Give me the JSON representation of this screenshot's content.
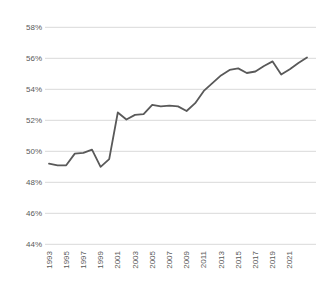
{
  "chart_data": {
    "type": "line",
    "title": "",
    "xlabel": "",
    "ylabel": "",
    "x": [
      1993,
      1994,
      1995,
      1996,
      1997,
      1998,
      1999,
      2000,
      2001,
      2002,
      2003,
      2004,
      2005,
      2006,
      2007,
      2008,
      2009,
      2010,
      2011,
      2012,
      2013,
      2014,
      2015,
      2016,
      2017,
      2018,
      2019,
      2020,
      2021,
      2022,
      2023
    ],
    "series": [
      {
        "name": "percentage-share",
        "values": [
          49.2,
          49.1,
          49.1,
          49.85,
          49.9,
          50.1,
          49.0,
          49.5,
          52.5,
          52.05,
          52.35,
          52.4,
          53.0,
          52.9,
          52.95,
          52.9,
          52.6,
          53.1,
          53.9,
          54.4,
          54.9,
          55.25,
          55.35,
          55.05,
          55.15,
          55.5,
          55.8,
          54.95,
          55.3,
          55.7,
          56.05
        ]
      }
    ],
    "xlim": [
      1993,
      2023
    ],
    "ylim": [
      44,
      58
    ],
    "y_tick_values": [
      44,
      46,
      48,
      50,
      52,
      54,
      56,
      58
    ],
    "y_tick_labels": [
      "44%",
      "46%",
      "48%",
      "50%",
      "52%",
      "54%",
      "56%",
      "58%"
    ],
    "x_tick_values": [
      1993,
      1995,
      1997,
      1999,
      2001,
      2003,
      2005,
      2007,
      2009,
      2011,
      2013,
      2015,
      2017,
      2019,
      2021
    ],
    "x_tick_labels": [
      "1993",
      "1995",
      "1997",
      "1999",
      "2001",
      "2003",
      "2005",
      "2007",
      "2009",
      "2011",
      "2013",
      "2015",
      "2017",
      "2019",
      "2021"
    ],
    "grid": "horizontal",
    "legend": "none",
    "x_tick_rotation": -90
  },
  "colors": {
    "background": "#ffffff",
    "line": "#595959",
    "gridline": "#d9d9d9",
    "tick_text": "#595959"
  }
}
